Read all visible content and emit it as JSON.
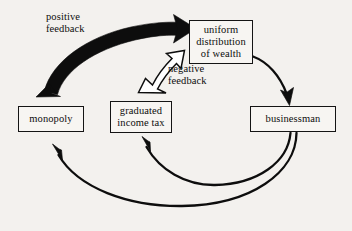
{
  "diagram": {
    "background_color": "#f3f1ee",
    "ink_color": "#0d0d0d",
    "nodes": [
      {
        "id": "uniform-distribution-of-wealth",
        "label": "uniform\ndistribution\nof wealth"
      },
      {
        "id": "monopoly",
        "label": "monopoly"
      },
      {
        "id": "graduated-income-tax",
        "label": "graduated\nincome tax"
      },
      {
        "id": "businessman",
        "label": "businessman"
      }
    ],
    "edge_labels": [
      {
        "id": "positive-feedback",
        "label": "positive\nfeedback"
      },
      {
        "id": "negative-feedback",
        "label": "negative\nfeedback"
      }
    ],
    "edges": [
      {
        "id": "monopoly-to-uniform-distribution",
        "from": "monopoly",
        "to": "uniform-distribution-of-wealth",
        "style": "thick-solid-black",
        "label": "positive feedback"
      },
      {
        "id": "graduated-income-tax-to-uniform-distribution",
        "from": "graduated income tax",
        "to": "uniform-distribution-of-wealth",
        "style": "hollow-outline-white",
        "label": "negative feedback"
      },
      {
        "id": "uniform-distribution-to-businessman",
        "from": "uniform-distribution-of-wealth",
        "to": "businessman",
        "style": "thin-solid-black",
        "label": ""
      },
      {
        "id": "businessman-to-graduated-income-tax",
        "from": "businessman",
        "to": "graduated income tax",
        "style": "thin-solid-black",
        "label": ""
      },
      {
        "id": "businessman-to-monopoly",
        "from": "businessman",
        "to": "monopoly",
        "style": "thin-solid-black",
        "label": ""
      }
    ]
  }
}
